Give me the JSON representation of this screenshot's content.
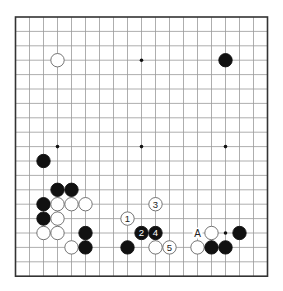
{
  "board": {
    "size": 19,
    "origin_x": 15.5,
    "origin_y": 17,
    "spacing_x": 14.0,
    "spacing_y": 14.4,
    "line_color": "#999999",
    "border_color": "#333333",
    "star_points": [
      [
        3,
        3
      ],
      [
        9,
        3
      ],
      [
        15,
        3
      ],
      [
        3,
        9
      ],
      [
        9,
        9
      ],
      [
        15,
        9
      ],
      [
        3,
        15
      ],
      [
        9,
        15
      ],
      [
        15,
        15
      ]
    ]
  },
  "stones": [
    {
      "color": "white",
      "col": 3,
      "row": 3,
      "label": ""
    },
    {
      "color": "black",
      "col": 15,
      "row": 3,
      "label": ""
    },
    {
      "color": "black",
      "col": 2,
      "row": 10,
      "label": ""
    },
    {
      "color": "black",
      "col": 3,
      "row": 12,
      "label": ""
    },
    {
      "color": "black",
      "col": 4,
      "row": 12,
      "label": ""
    },
    {
      "color": "black",
      "col": 2,
      "row": 13,
      "label": ""
    },
    {
      "color": "white",
      "col": 3,
      "row": 13,
      "label": ""
    },
    {
      "color": "white",
      "col": 4,
      "row": 13,
      "label": ""
    },
    {
      "color": "white",
      "col": 5,
      "row": 13,
      "label": ""
    },
    {
      "color": "black",
      "col": 2,
      "row": 14,
      "label": ""
    },
    {
      "color": "white",
      "col": 3,
      "row": 14,
      "label": ""
    },
    {
      "color": "white",
      "col": 2,
      "row": 15,
      "label": ""
    },
    {
      "color": "white",
      "col": 3,
      "row": 15,
      "label": ""
    },
    {
      "color": "black",
      "col": 5,
      "row": 15,
      "label": ""
    },
    {
      "color": "white",
      "col": 4,
      "row": 16,
      "label": ""
    },
    {
      "color": "black",
      "col": 5,
      "row": 16,
      "label": ""
    },
    {
      "color": "white",
      "col": 8,
      "row": 14,
      "label": "1"
    },
    {
      "color": "black",
      "col": 9,
      "row": 15,
      "label": "2"
    },
    {
      "color": "white",
      "col": 10,
      "row": 13,
      "label": "3"
    },
    {
      "color": "black",
      "col": 10,
      "row": 15,
      "label": "4"
    },
    {
      "color": "white",
      "col": 11,
      "row": 16,
      "label": "5"
    },
    {
      "color": "black",
      "col": 8,
      "row": 16,
      "label": ""
    },
    {
      "color": "white",
      "col": 10,
      "row": 16,
      "label": ""
    },
    {
      "color": "white",
      "col": 14,
      "row": 15,
      "label": ""
    },
    {
      "color": "black",
      "col": 16,
      "row": 15,
      "label": ""
    },
    {
      "color": "white",
      "col": 13,
      "row": 16,
      "label": ""
    },
    {
      "color": "black",
      "col": 14,
      "row": 16,
      "label": ""
    },
    {
      "color": "black",
      "col": 15,
      "row": 16,
      "label": ""
    }
  ],
  "markers": [
    {
      "text": "A",
      "col": 13,
      "row": 15
    }
  ]
}
